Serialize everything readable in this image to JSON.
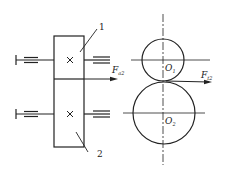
{
  "diagram": {
    "type": "gear-force-diagram",
    "colors": {
      "line": "#222222",
      "background": "#ffffff"
    },
    "side_view": {
      "part_labels": [
        "1",
        "2"
      ],
      "axial_force": {
        "symbol": "F",
        "subscript": "a2"
      },
      "marks": [
        "x-mark",
        "x-mark"
      ]
    },
    "front_view": {
      "centers": [
        {
          "symbol": "O",
          "subscript": "1"
        },
        {
          "symbol": "O",
          "subscript": "2"
        }
      ],
      "tangential_force": {
        "symbol": "F",
        "subscript": "t2"
      }
    }
  }
}
